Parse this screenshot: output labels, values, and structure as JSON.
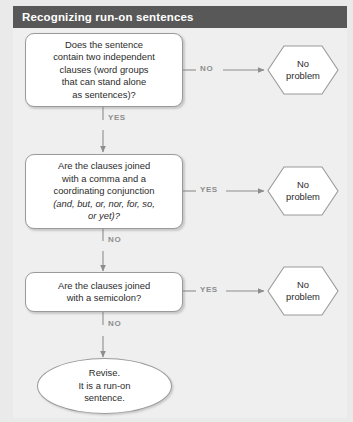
{
  "header": {
    "title": "Recognizing run-on sentences"
  },
  "diagram": {
    "type": "flowchart",
    "nodes": [
      {
        "id": "q1",
        "shape": "rounded-rect",
        "role": "decision",
        "lines": [
          "Does the sentence",
          "contain two independent",
          "clauses (word groups",
          "that can stand alone",
          "as sentences)?"
        ]
      },
      {
        "id": "q2",
        "shape": "rounded-rect",
        "role": "decision",
        "lines": [
          "Are the clauses joined",
          "with a comma and a",
          "coordinating conjunction",
          "(and, but, or, nor, for, so,",
          "or yet)?"
        ],
        "italic_part": "and, but, or, nor, for, so, or yet"
      },
      {
        "id": "q3",
        "shape": "rounded-rect",
        "role": "decision",
        "lines": [
          "Are the clauses joined",
          "with a semicolon?"
        ]
      },
      {
        "id": "out1",
        "shape": "hexagon",
        "role": "outcome",
        "lines": [
          "No",
          "problem"
        ]
      },
      {
        "id": "out2",
        "shape": "hexagon",
        "role": "outcome",
        "lines": [
          "No",
          "problem"
        ]
      },
      {
        "id": "out3",
        "shape": "hexagon",
        "role": "outcome",
        "lines": [
          "No",
          "problem"
        ]
      },
      {
        "id": "end",
        "shape": "ellipse",
        "role": "terminal",
        "lines": [
          "Revise.",
          "It is a run-on",
          "sentence."
        ]
      }
    ],
    "edges": [
      {
        "id": "e1",
        "from": "q1",
        "to": "out1",
        "label": "NO",
        "direction": "right"
      },
      {
        "id": "e2",
        "from": "q1",
        "to": "q2",
        "label": "YES",
        "direction": "down"
      },
      {
        "id": "e3",
        "from": "q2",
        "to": "out2",
        "label": "YES",
        "direction": "right"
      },
      {
        "id": "e4",
        "from": "q2",
        "to": "q3",
        "label": "NO",
        "direction": "down"
      },
      {
        "id": "e5",
        "from": "q3",
        "to": "out3",
        "label": "YES",
        "direction": "right"
      },
      {
        "id": "e6",
        "from": "q3",
        "to": "end",
        "label": "NO",
        "direction": "down"
      }
    ]
  },
  "colors": {
    "header_band": "#585858",
    "header_text": "#ffffff",
    "page_background": "#efefef",
    "node_fill": "#ffffff",
    "node_border": "#9a9a9a",
    "connector": "#8d8d8d",
    "edge_label_text": "#8d8d8d",
    "body_text": "#2b2b2b"
  }
}
